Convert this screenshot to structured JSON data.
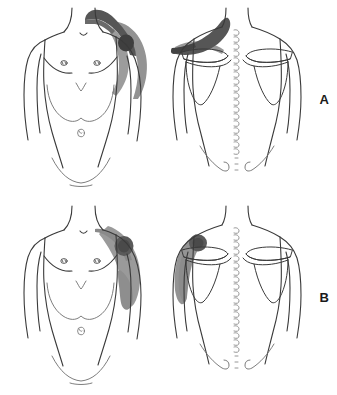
{
  "figure": {
    "type": "medical-illustration",
    "background_color": "#ffffff",
    "outline_color": "#3a3a3a",
    "shading": {
      "dark_gray": "#5a5a5a",
      "medium_gray": "#8c8c8c",
      "light_gray": "#a8a8a8"
    }
  },
  "panels": [
    {
      "id": "A",
      "label": "A",
      "views": [
        {
          "id": "anterior",
          "name": "anterior-body-a",
          "regions": [
            {
              "name": "trapezius-clavicle-band",
              "tone": "dark_gray"
            },
            {
              "name": "acromioclavicular-spot",
              "tone": "dark_gray"
            },
            {
              "name": "lateral-deltoid-arm-shading",
              "tone": "medium_gray"
            }
          ]
        },
        {
          "id": "posterior",
          "name": "posterior-body-a",
          "regions": [
            {
              "name": "upper-trapezius-band",
              "tone": "dark_gray"
            },
            {
              "name": "suprascapular-shading",
              "tone": "medium_gray"
            }
          ]
        }
      ]
    },
    {
      "id": "B",
      "label": "B",
      "views": [
        {
          "id": "anterior",
          "name": "anterior-body-b",
          "regions": [
            {
              "name": "deltoid-spot",
              "tone": "dark_gray"
            },
            {
              "name": "lateral-chest-arm-shading",
              "tone": "medium_gray"
            }
          ]
        },
        {
          "id": "posterior",
          "name": "posterior-body-b",
          "regions": [
            {
              "name": "posterior-deltoid-spot",
              "tone": "dark_gray"
            },
            {
              "name": "lateral-shoulder-shading",
              "tone": "medium_gray"
            }
          ]
        }
      ]
    }
  ],
  "anatomy": {
    "anterior_features": [
      "neck",
      "clavicles",
      "pectoral-contour",
      "nipples",
      "costal-margin",
      "navel",
      "inguinal-crease",
      "arms"
    ],
    "posterior_features": [
      "neck",
      "scapulae",
      "spine-of-scapula",
      "acromion",
      "vertebral-spinous-processes",
      "iliac-crests",
      "arms"
    ]
  }
}
